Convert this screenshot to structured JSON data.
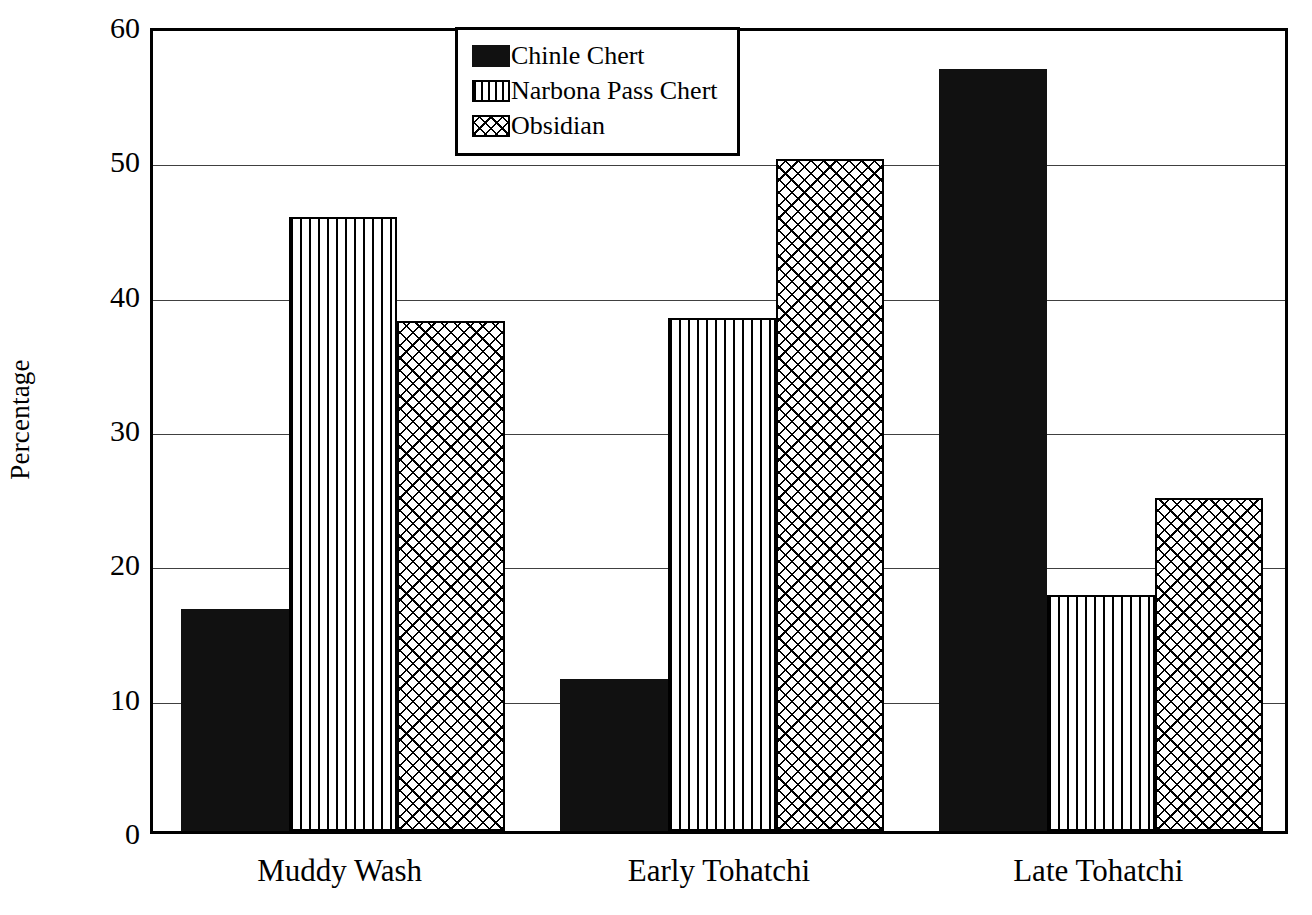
{
  "chart_data": {
    "type": "bar",
    "title": "",
    "subtitle": "",
    "xlabel": "",
    "ylabel": "Percentage",
    "categories": [
      "Muddy Wash",
      "Early Tohatchi",
      "Late Tohatchi"
    ],
    "series": [
      {
        "name": "Chinle Chert",
        "pattern": "solid",
        "values": [
          16.5,
          11.3,
          56.7
        ]
      },
      {
        "name": "Narbona Pass Chert",
        "pattern": "vstripe",
        "values": [
          45.7,
          38.2,
          17.6
        ]
      },
      {
        "name": "Obsidian",
        "pattern": "crosshatch",
        "values": [
          38.0,
          50.0,
          24.8
        ]
      }
    ],
    "ylim": [
      0,
      60
    ],
    "yticks": [
      0,
      10,
      20,
      30,
      40,
      50,
      60
    ],
    "ytick_labels": [
      "0",
      "10",
      "20",
      "30",
      "40",
      "50",
      "60"
    ],
    "grid": "horizontal",
    "legend_position": "top-center",
    "colors": {
      "foreground": "#000000",
      "background": "#ffffff",
      "bar_fill_solid": "#111111",
      "bar_fill_pattern": "#ffffff",
      "gridline": "#000000"
    }
  },
  "legend": {
    "entries": [
      {
        "label": "Chinle Chert",
        "pattern": "solid"
      },
      {
        "label": "Narbona Pass Chert",
        "pattern": "vstripe"
      },
      {
        "label": "Obsidian",
        "pattern": "crosshatch"
      }
    ]
  }
}
